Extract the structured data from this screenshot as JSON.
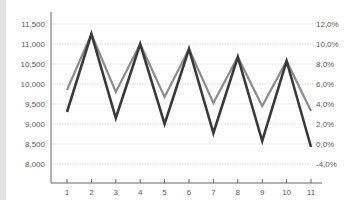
{
  "chart_data": {
    "type": "line",
    "title": "",
    "xlabel": "",
    "ylabel": "",
    "x": [
      1,
      2,
      3,
      4,
      5,
      6,
      7,
      8,
      9,
      10,
      11
    ],
    "series": [
      {
        "name": "Series A (light)",
        "color": "#8c8c8c",
        "axis": "left",
        "values": [
          9850,
          11250,
          9800,
          11000,
          9675,
          10875,
          9525,
          10675,
          9450,
          10575,
          9325
        ]
      },
      {
        "name": "Series B (dark)",
        "color": "#3a3a3a",
        "axis": "left",
        "values": [
          9300,
          11250,
          9150,
          11000,
          9000,
          10875,
          8775,
          10675,
          8575,
          10575,
          8425
        ]
      }
    ],
    "y_left": {
      "ticks": [
        11500,
        11000,
        10500,
        10000,
        9500,
        9000,
        8500,
        8000
      ],
      "tick_labels": [
        "11,500",
        "11,000",
        "10,500",
        "10,000",
        "9,500",
        "9,000",
        "8,500",
        "8,000"
      ],
      "ylim": [
        7525,
        11800
      ]
    },
    "y_right": {
      "tick_labels": [
        "12,0%",
        "10,0%",
        "8,0%",
        "6,0%",
        "4,0%",
        "2,0%",
        "0,0%",
        "-4,0%"
      ]
    },
    "x_tick_labels": [
      "1",
      "2",
      "3",
      "4",
      "5",
      "6",
      "7",
      "8",
      "9",
      "10",
      "11"
    ],
    "grid": true,
    "legend": "none"
  },
  "colors": {
    "light_line": "#8c8c8c",
    "dark_line": "#3a3a3a",
    "grid": "#d6d6d6",
    "axis": "#666666",
    "left_strip": "#e2e2e2"
  }
}
